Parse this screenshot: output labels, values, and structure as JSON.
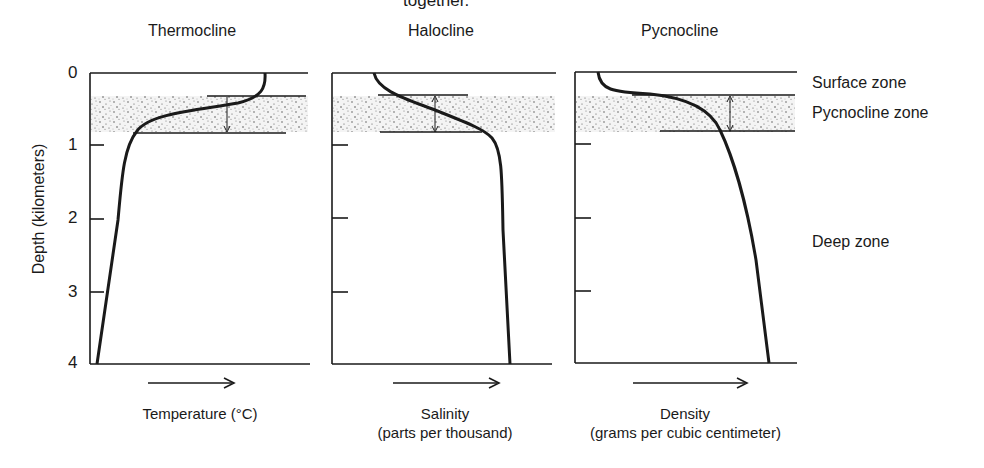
{
  "header": {
    "caption_fragment": "together."
  },
  "y_axis": {
    "label": "Depth (kilometers)",
    "ticks": [
      "0",
      "1",
      "2",
      "3",
      "4"
    ]
  },
  "panels": [
    {
      "title": "Thermocline",
      "xlabel": "Temperature (°C)",
      "xlabel_sub": "",
      "arrow": "→"
    },
    {
      "title": "Halocline",
      "xlabel": "Salinity",
      "xlabel_sub": "(parts per thousand)",
      "arrow": "→"
    },
    {
      "title": "Pycnocline",
      "xlabel": "Density",
      "xlabel_sub": "(grams per cubic centimeter)",
      "arrow": "→"
    }
  ],
  "zones": {
    "surface": "Surface zone",
    "pycnocline": "Pycnocline zone",
    "deep": "Deep zone"
  },
  "colors": {
    "ink": "#1a1a1a",
    "stipple": "#555555",
    "background": "#ffffff"
  }
}
